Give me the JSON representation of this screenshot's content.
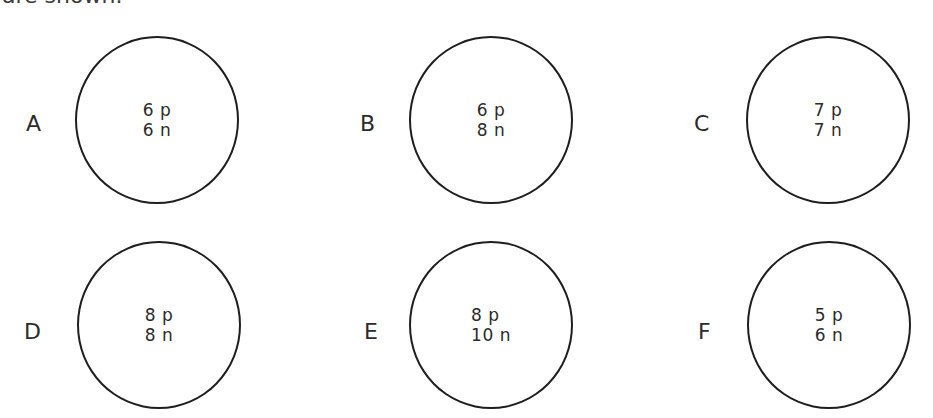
{
  "heading": "are shown:",
  "atoms": [
    {
      "label": "A",
      "protons": "6 p",
      "neutrons": "6 n"
    },
    {
      "label": "B",
      "protons": "6 p",
      "neutrons": "8 n"
    },
    {
      "label": "C",
      "protons": "7 p",
      "neutrons": "7 n"
    },
    {
      "label": "D",
      "protons": "8 p",
      "neutrons": "8 n"
    },
    {
      "label": "E",
      "protons": "8 p",
      "neutrons": "10 n"
    },
    {
      "label": "F",
      "protons": "5 p",
      "neutrons": "6 n"
    }
  ]
}
